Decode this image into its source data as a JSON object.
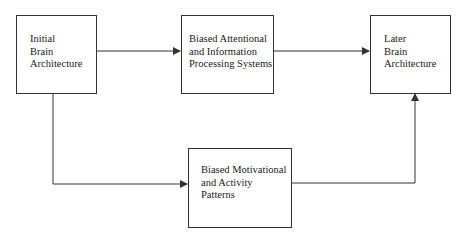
{
  "diagram": {
    "nodes": [
      {
        "id": "initial",
        "label": "Initial\nBrain\nArchitecture"
      },
      {
        "id": "attention",
        "label": "Biased Attentional\nand Information\nProcessing Systems"
      },
      {
        "id": "later",
        "label": "Later\nBrain\nArchitecture"
      },
      {
        "id": "motivation",
        "label": "Biased Motivational\nand Activity\nPatterns"
      }
    ],
    "edges": [
      {
        "from": "initial",
        "to": "attention"
      },
      {
        "from": "attention",
        "to": "later"
      },
      {
        "from": "initial",
        "to": "motivation"
      },
      {
        "from": "motivation",
        "to": "later"
      }
    ],
    "colors": {
      "stroke": "#333333",
      "background": "#ffffff",
      "text": "#1a1a1a"
    }
  }
}
